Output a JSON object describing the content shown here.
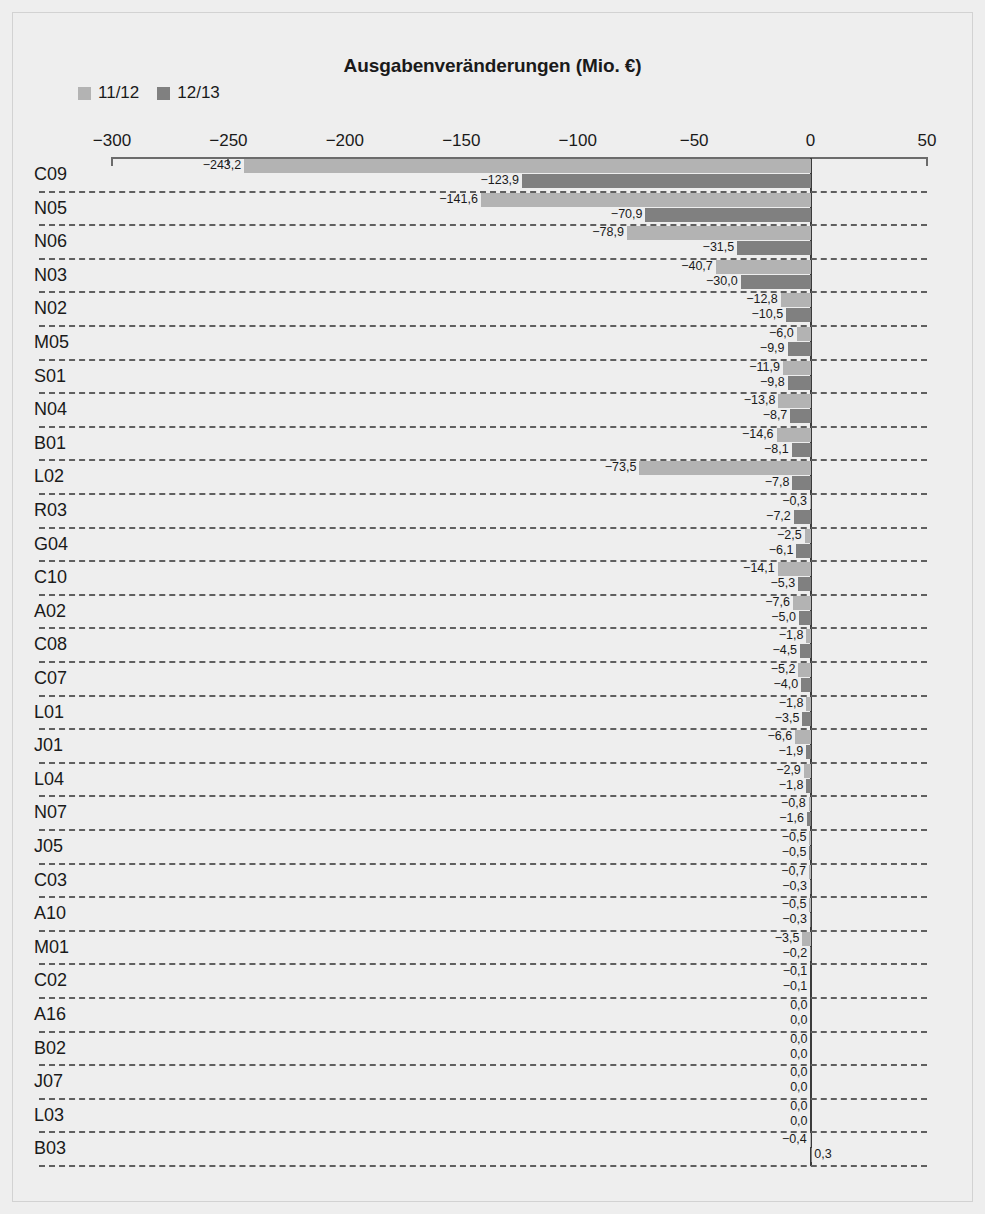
{
  "chart_data": {
    "type": "bar",
    "orientation": "horizontal",
    "title": "Ausgabenveränderungen (Mio. €)",
    "xlabel": "",
    "ylabel": "",
    "xlim": [
      -300,
      50
    ],
    "xticks": [
      -300,
      -250,
      -200,
      -150,
      -100,
      -50,
      0,
      50
    ],
    "xtick_labels": [
      "−300",
      "−250",
      "−200",
      "−150",
      "−100",
      "−50",
      "0",
      "50"
    ],
    "grid": false,
    "legend_position": "top-left",
    "decimal_separator": ",",
    "colors": {
      "series_11_12": "#b3b3b3",
      "series_12_13": "#808080",
      "background": "#eeeeee",
      "axis": "#6b6b6b",
      "zero_line": "#3b3b3b",
      "separator": "#5f5f5f",
      "text": "#1a1a1a"
    },
    "categories": [
      "C09",
      "N05",
      "N06",
      "N03",
      "N02",
      "M05",
      "S01",
      "N04",
      "B01",
      "L02",
      "R03",
      "G04",
      "C10",
      "A02",
      "C08",
      "C07",
      "L01",
      "J01",
      "L04",
      "N07",
      "J05",
      "C03",
      "A10",
      "M01",
      "C02",
      "A16",
      "B02",
      "J07",
      "L03",
      "B03"
    ],
    "series": [
      {
        "name": "11/12",
        "color": "#b3b3b3",
        "values": [
          -243.2,
          -141.6,
          -78.9,
          -40.7,
          -12.8,
          -6.0,
          -11.9,
          -13.8,
          -14.6,
          -73.5,
          -0.3,
          -2.5,
          -14.1,
          -7.6,
          -1.8,
          -5.2,
          -1.8,
          -6.6,
          -2.9,
          -0.8,
          -0.5,
          -0.7,
          -0.5,
          -3.5,
          -0.1,
          0.0,
          0.0,
          0.0,
          0.0,
          -0.4
        ],
        "labels": [
          "−243,2",
          "−141,6",
          "−78,9",
          "−40,7",
          "−12,8",
          "−6,0",
          "−11,9",
          "−13,8",
          "−14,6",
          "−73,5",
          "−0,3",
          "−2,5",
          "−14,1",
          "−7,6",
          "−1,8",
          "−5,2",
          "−1,8",
          "−6,6",
          "−2,9",
          "−0,8",
          "−0,5",
          "−0,7",
          "−0,5",
          "−3,5",
          "−0,1",
          "0,0",
          "0,0",
          "0,0",
          "0,0",
          "−0,4"
        ]
      },
      {
        "name": "12/13",
        "color": "#808080",
        "values": [
          -123.9,
          -70.9,
          -31.5,
          -30.0,
          -10.5,
          -9.9,
          -9.8,
          -8.7,
          -8.1,
          -7.8,
          -7.2,
          -6.1,
          -5.3,
          -5.0,
          -4.5,
          -4.0,
          -3.5,
          -1.9,
          -1.8,
          -1.6,
          -0.5,
          -0.3,
          -0.3,
          -0.2,
          -0.1,
          0.0,
          0.0,
          0.0,
          0.0,
          0.3
        ],
        "labels": [
          "−123,9",
          "−70,9",
          "−31,5",
          "−30,0",
          "−10,5",
          "−9,9",
          "−9,8",
          "−8,7",
          "−8,1",
          "−7,8",
          "−7,2",
          "−6,1",
          "−5,3",
          "−5,0",
          "−4,5",
          "−4,0",
          "−3,5",
          "−1,9",
          "−1,8",
          "−1,6",
          "−0,5",
          "−0,3",
          "−0,3",
          "−0,2",
          "−0,1",
          "0,0",
          "0,0",
          "0,0",
          "0,0",
          "0,3"
        ]
      }
    ]
  },
  "legend": {
    "items": [
      {
        "label": "11/12",
        "color": "#b3b3b3"
      },
      {
        "label": "12/13",
        "color": "#808080"
      }
    ]
  }
}
